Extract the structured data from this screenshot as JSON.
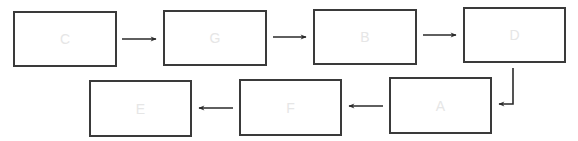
{
  "diagram": {
    "type": "flowchart",
    "nodes": [
      {
        "id": "C",
        "label": "C"
      },
      {
        "id": "G",
        "label": "G"
      },
      {
        "id": "B",
        "label": "B"
      },
      {
        "id": "D",
        "label": "D"
      },
      {
        "id": "A",
        "label": "A"
      },
      {
        "id": "F",
        "label": "F"
      },
      {
        "id": "E",
        "label": "E"
      }
    ],
    "edges": [
      {
        "from": "C",
        "to": "G"
      },
      {
        "from": "G",
        "to": "B"
      },
      {
        "from": "B",
        "to": "D"
      },
      {
        "from": "D",
        "to": "A"
      },
      {
        "from": "A",
        "to": "F"
      },
      {
        "from": "F",
        "to": "E"
      }
    ],
    "colors": {
      "border": "#3a3a3a",
      "arrow": "#2a2a2a",
      "label": "#e6e6e6"
    }
  }
}
